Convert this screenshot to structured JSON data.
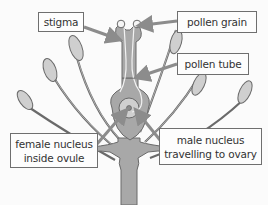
{
  "diagram": {
    "type": "labeled-illustration",
    "colors": {
      "plant_fill": "#a8a8a8",
      "plant_stroke": "#6a6a6a",
      "petal_fill": "#cfcfcf",
      "arrow_fill": "#8c8c8c",
      "label_border": "#6f6f6f",
      "label_bg": "#fdfdfd",
      "text": "#333333"
    },
    "labels": {
      "stigma": {
        "text": "stigma"
      },
      "pollen_grain": {
        "text": "pollen grain"
      },
      "pollen_tube": {
        "text": "pollen tube"
      },
      "female_nucleus": {
        "line1": "female nucleus",
        "line2": "inside ovule"
      },
      "male_nucleus": {
        "line1": "male nucleus",
        "line2": "travelling to ovary"
      }
    }
  }
}
